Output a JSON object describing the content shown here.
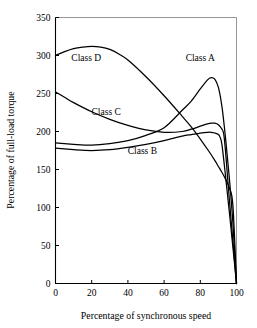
{
  "chart_data": {
    "type": "line",
    "title": "",
    "xlabel": "Percentage of synchronous speed",
    "ylabel": "Percentage of full-load torque",
    "xlim": [
      0,
      100
    ],
    "ylim": [
      0,
      350
    ],
    "xticks": [
      0,
      20,
      40,
      60,
      80,
      100
    ],
    "yticks": [
      0,
      50,
      100,
      150,
      200,
      250,
      300,
      350
    ],
    "grid": false,
    "legend": "inline-labels",
    "series": [
      {
        "name": "Class A",
        "label": "Class A",
        "label_x": 80,
        "label_y": 293,
        "x": [
          0,
          5,
          10,
          20,
          30,
          40,
          50,
          60,
          70,
          75,
          80,
          84,
          86,
          88,
          90,
          92,
          94,
          96,
          98,
          100
        ],
        "y": [
          185,
          184,
          183,
          182,
          184,
          188,
          195,
          205,
          228,
          240,
          256,
          268,
          271,
          269,
          258,
          232,
          190,
          140,
          80,
          0
        ]
      },
      {
        "name": "Class B",
        "label": "Class B",
        "label_x": 48,
        "label_y": 170,
        "x": [
          0,
          5,
          10,
          20,
          30,
          40,
          50,
          60,
          70,
          75,
          80,
          84,
          86,
          88,
          90,
          91,
          92,
          94,
          96,
          98,
          100
        ],
        "y": [
          178,
          177,
          176,
          175,
          176,
          179,
          183,
          188,
          194,
          196,
          198,
          199,
          199,
          198,
          196,
          192,
          182,
          140,
          95,
          48,
          0
        ]
      },
      {
        "name": "Class C",
        "label": "Class C",
        "label_x": 28,
        "label_y": 222,
        "x": [
          0,
          5,
          10,
          20,
          30,
          40,
          50,
          60,
          70,
          75,
          80,
          84,
          86,
          88,
          90,
          92,
          93,
          94,
          96,
          98,
          100
        ],
        "y": [
          252,
          245,
          238,
          226,
          216,
          208,
          202,
          199,
          200,
          203,
          207,
          210,
          211,
          211,
          209,
          203,
          196,
          172,
          112,
          56,
          0
        ]
      },
      {
        "name": "Class D",
        "label": "Class D",
        "label_x": 17,
        "label_y": 293,
        "x": [
          0,
          5,
          10,
          15,
          20,
          25,
          30,
          35,
          40,
          50,
          60,
          70,
          75,
          80,
          85,
          88,
          90,
          92,
          94,
          96,
          98,
          100
        ],
        "y": [
          300,
          305,
          309,
          311,
          312,
          311,
          308,
          302,
          294,
          272,
          247,
          220,
          206,
          190,
          173,
          162,
          154,
          146,
          137,
          126,
          103,
          0
        ]
      }
    ]
  },
  "axes": {
    "x_tick_labels": [
      "0",
      "20",
      "40",
      "60",
      "80",
      "100"
    ],
    "y_tick_labels": [
      "0",
      "50",
      "100",
      "150",
      "200",
      "250",
      "300",
      "350"
    ],
    "x_title": "Percentage of synchronous speed",
    "y_title": "Percentage of full-load torque"
  }
}
